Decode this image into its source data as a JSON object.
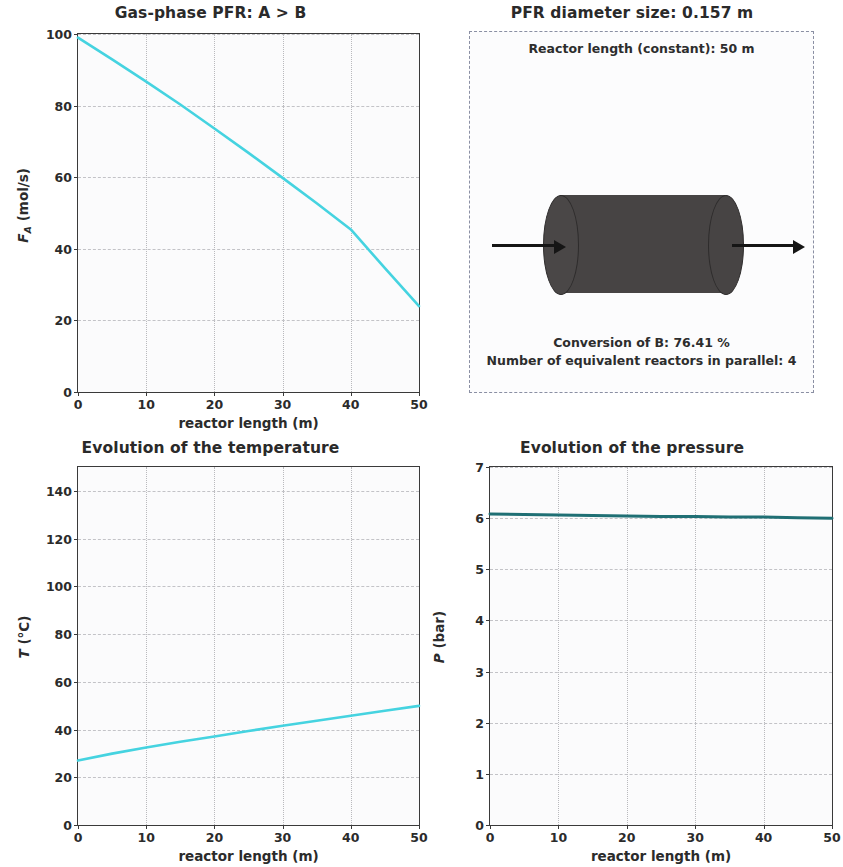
{
  "figure": {
    "width": 843,
    "height": 867,
    "background": "#ffffff",
    "line_color_primary": "#45d3e0",
    "line_color_pressure": "#1f6f74",
    "reactor_color": "#474444"
  },
  "panels": {
    "flow": {
      "title": "Gas-phase PFR: A > B",
      "xlabel": "reactor length (m)",
      "ylabel_main": "F",
      "ylabel_sub": "A",
      "ylabel_unit": " (mol/s)",
      "yticks": [
        "0",
        "20",
        "40",
        "60",
        "80",
        "100"
      ],
      "xticks": [
        "0",
        "10",
        "20",
        "30",
        "40",
        "50"
      ]
    },
    "reactor": {
      "title": "PFR diameter size: 0.157 m",
      "top_note": "Reactor length (constant): 50 m",
      "bottom_note_1": "Conversion of B: 76.41 %",
      "bottom_note_2": "Number of equivalent reactors in parallel: 4"
    },
    "temperature": {
      "title": "Evolution of the temperature",
      "xlabel": "reactor length (m)",
      "ylabel_main": "T",
      "ylabel_unit": " (°C)",
      "yticks": [
        "0",
        "20",
        "40",
        "60",
        "80",
        "100",
        "120",
        "140"
      ],
      "xticks": [
        "0",
        "10",
        "20",
        "30",
        "40",
        "50"
      ]
    },
    "pressure": {
      "title": "Evolution of the pressure",
      "xlabel": "reactor length (m)",
      "ylabel_main": "P",
      "ylabel_unit": " (bar)",
      "yticks": [
        "0",
        "1",
        "2",
        "3",
        "4",
        "5",
        "6",
        "7"
      ],
      "xticks": [
        "0",
        "10",
        "20",
        "30",
        "40",
        "50"
      ]
    }
  },
  "chart_data": [
    {
      "type": "line",
      "title": "Gas-phase PFR: A > B",
      "xlabel": "reactor length (m)",
      "ylabel": "F_A (mol/s)",
      "xlim": [
        0,
        50
      ],
      "ylim": [
        0,
        100
      ],
      "grid": true,
      "legend": null,
      "x": [
        0,
        5,
        10,
        15,
        20,
        25,
        30,
        35,
        40,
        45,
        50
      ],
      "series": [
        {
          "name": "F_A",
          "color": "#45d3e0",
          "values": [
            99.0,
            92.9,
            86.7,
            80.3,
            73.6,
            66.8,
            59.8,
            52.7,
            45.4,
            34.6,
            24.0
          ]
        }
      ]
    },
    {
      "type": "diagram",
      "title": "PFR diameter size: 0.157 m",
      "annotations": [
        "Reactor length (constant): 50 m",
        "Conversion of B: 76.41 %",
        "Number of equivalent reactors in parallel: 4"
      ],
      "xlim": [
        0,
        1
      ],
      "ylim": [
        0,
        1
      ],
      "grid": false
    },
    {
      "type": "line",
      "title": "Evolution of the temperature",
      "xlabel": "reactor length (m)",
      "ylabel": "T (°C)",
      "xlim": [
        0,
        50
      ],
      "ylim": [
        0,
        150
      ],
      "grid": true,
      "legend": null,
      "x": [
        0,
        5,
        10,
        15,
        20,
        25,
        30,
        35,
        40,
        45,
        50
      ],
      "series": [
        {
          "name": "T",
          "color": "#45d3e0",
          "values": [
            27.0,
            29.9,
            32.5,
            34.9,
            37.1,
            39.4,
            41.6,
            43.7,
            45.8,
            47.9,
            49.9
          ]
        }
      ]
    },
    {
      "type": "line",
      "title": "Evolution of the pressure",
      "xlabel": "reactor length (m)",
      "ylabel": "P (bar)",
      "xlim": [
        0,
        50
      ],
      "ylim": [
        0,
        7
      ],
      "grid": true,
      "legend": null,
      "x": [
        0,
        5,
        10,
        15,
        20,
        25,
        30,
        35,
        40,
        45,
        50
      ],
      "series": [
        {
          "name": "P",
          "color": "#1f6f74",
          "values": [
            6.08,
            6.07,
            6.06,
            6.05,
            6.04,
            6.03,
            6.03,
            6.02,
            6.02,
            6.01,
            6.0
          ]
        }
      ]
    }
  ]
}
